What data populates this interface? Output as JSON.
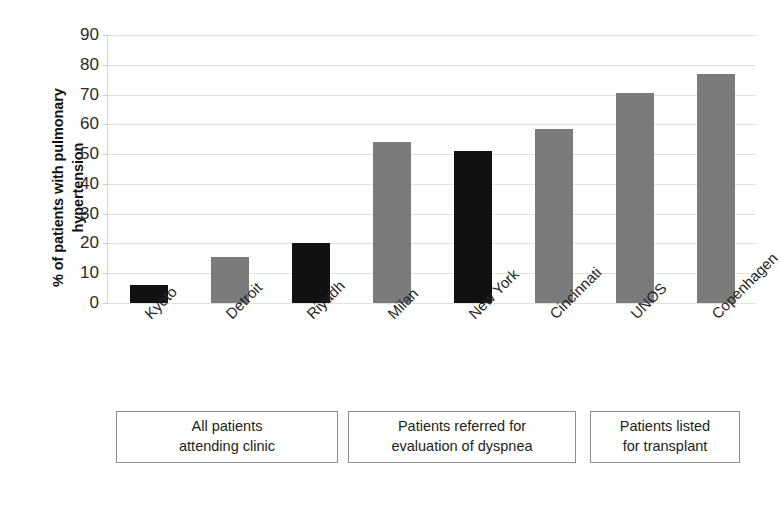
{
  "chart_data": {
    "type": "bar",
    "title": "",
    "subtitle": "",
    "xlabel": "",
    "ylabel": "% of patients with pulmonary hypertension",
    "ylim": [
      0,
      90
    ],
    "ytick_labels": [
      "0",
      "10",
      "20",
      "30",
      "40",
      "50",
      "60",
      "70",
      "80",
      "90"
    ],
    "ytick_values": [
      0,
      10,
      20,
      30,
      40,
      50,
      60,
      70,
      80,
      90
    ],
    "grid": true,
    "legend": "none",
    "categories": [
      "Kyoto",
      "Detroit",
      "Riyadh",
      "Milan",
      "New York",
      "Cincinnati",
      "UNOS",
      "Copenhagen"
    ],
    "values": [
      6,
      15.5,
      20,
      54,
      51,
      58.5,
      70.5,
      77
    ],
    "bar_colors": [
      "#111111",
      "#7b7b7b",
      "#111111",
      "#7b7b7b",
      "#111111",
      "#7b7b7b",
      "#7b7b7b",
      "#7b7b7b"
    ],
    "annotations": [
      {
        "label": "All patients attending clinic",
        "line1": "All patients",
        "line2": "attending clinic",
        "covers": [
          "Kyoto",
          "Detroit",
          "Riyadh"
        ]
      },
      {
        "label": "Patients referred for evaluation of dyspnea",
        "line1": "Patients referred for",
        "line2": "evaluation of dyspnea",
        "covers": [
          "Milan",
          "New York",
          "Cincinnati"
        ]
      },
      {
        "label": "Patients listed for transplant",
        "line1": "Patients listed",
        "line2": "for transplant",
        "covers": [
          "UNOS",
          "Copenhagen"
        ]
      }
    ]
  },
  "colors": {
    "dark_bar": "#111111",
    "gray_bar": "#7b7b7b",
    "gridline": "#e2e2e2",
    "box_border": "#8d8d8d",
    "text": "#1a1a1a"
  }
}
